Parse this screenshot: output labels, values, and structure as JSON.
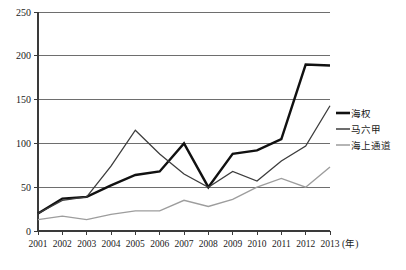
{
  "chart_data": {
    "type": "line",
    "title": "",
    "xlabel": "年",
    "ylabel": "",
    "grid": true,
    "legend_position": "right",
    "categories": [
      "2001",
      "2002",
      "2003",
      "2004",
      "2005",
      "2006",
      "2007",
      "2008",
      "2009",
      "2010",
      "2011",
      "2012",
      "2013"
    ],
    "x": [
      2001,
      2002,
      2003,
      2004,
      2005,
      2006,
      2007,
      2008,
      2009,
      2010,
      2011,
      2012,
      2013
    ],
    "ylim": [
      0,
      250
    ],
    "yticks": [
      0,
      50,
      100,
      150,
      200,
      250
    ],
    "xlim": [
      2001,
      2013
    ],
    "series": [
      {
        "name": "海权",
        "color": "#111111",
        "width": 2.4,
        "values": [
          20,
          37,
          39,
          52,
          64,
          68,
          100,
          50,
          88,
          92,
          105,
          190,
          189
        ]
      },
      {
        "name": "马六甲",
        "color": "#3d3d3d",
        "width": 1.3,
        "values": [
          20,
          35,
          39,
          74,
          115,
          88,
          65,
          50,
          68,
          57,
          80,
          97,
          143
        ]
      },
      {
        "name": "海上通道",
        "color": "#9d9d9d",
        "width": 1.4,
        "values": [
          13,
          17,
          13,
          19,
          23,
          23,
          35,
          28,
          36,
          50,
          60,
          50,
          73
        ]
      }
    ]
  },
  "axis": {
    "y_tick_labels": [
      "0",
      "50",
      "100",
      "150",
      "200",
      "250"
    ],
    "x_tick_labels": [
      "2001",
      "2002",
      "2003",
      "2004",
      "2005",
      "2006",
      "2007",
      "2008",
      "2009",
      "2010",
      "2011",
      "2012",
      "2013"
    ],
    "x_unit_label": "(年)"
  },
  "legend": {
    "items": [
      {
        "label": "海权",
        "color": "#111111",
        "width": 2.6
      },
      {
        "label": "马六甲",
        "color": "#3d3d3d",
        "width": 1.5
      },
      {
        "label": "海上通道",
        "color": "#9d9d9d",
        "width": 1.5
      }
    ]
  }
}
